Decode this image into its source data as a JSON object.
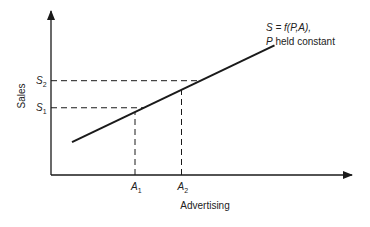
{
  "chart_data": {
    "type": "line",
    "title": "",
    "xlabel": "Advertising",
    "ylabel": "Sales",
    "annotation": {
      "line1": "S = f(P,A),",
      "line2_var": "P",
      "line2_rest": " held constant"
    },
    "x_ticks": [
      {
        "base": "A",
        "sub": "1",
        "value": 0.28
      },
      {
        "base": "A",
        "sub": "2",
        "value": 0.435
      }
    ],
    "y_ticks": [
      {
        "base": "S",
        "sub": "1",
        "value": 0.41
      },
      {
        "base": "S",
        "sub": "2",
        "value": 0.575
      }
    ],
    "series": [
      {
        "name": "S = f(P,A)",
        "points": [
          [
            0.07,
            0.2
          ],
          [
            0.745,
            0.79
          ]
        ]
      }
    ],
    "xlim": [
      0,
      1
    ],
    "ylim": [
      0,
      1
    ],
    "grid": false,
    "legend": "none",
    "colors": {
      "ink": "#1a1a1a"
    }
  }
}
